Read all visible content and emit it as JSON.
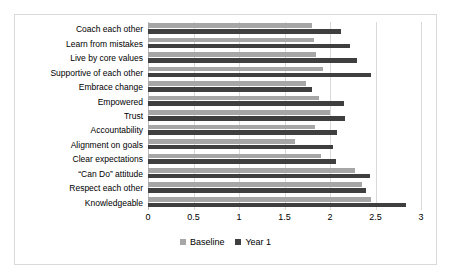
{
  "chart_data": {
    "type": "bar",
    "orientation": "horizontal",
    "title": "",
    "xlabel": "",
    "ylabel": "",
    "xlim": [
      0,
      3
    ],
    "xticks": [
      "0",
      "0.5",
      "1",
      "1.5",
      "2",
      "2.5",
      "3"
    ],
    "grid": true,
    "legend_position": "bottom",
    "categories": [
      "Coach each other",
      "Learn from mistakes",
      "Live by core values",
      "Supportive of each other",
      "Embrace change",
      "Empowered",
      "Trust",
      "Accountability",
      "Alignment on goals",
      "Clear expectations",
      "“Can Do” attitude",
      "Respect each other",
      "Knowledgeable"
    ],
    "series": [
      {
        "name": "Baseline",
        "color": "#a6a6a6",
        "values": [
          1.8,
          1.82,
          1.85,
          1.92,
          1.74,
          1.88,
          2.0,
          1.84,
          1.62,
          1.9,
          2.28,
          2.35,
          2.45
        ]
      },
      {
        "name": "Year 1",
        "color": "#3f3f3f",
        "values": [
          2.12,
          2.22,
          2.3,
          2.45,
          1.8,
          2.15,
          2.16,
          2.08,
          2.03,
          2.07,
          2.44,
          2.4,
          2.83
        ]
      }
    ]
  },
  "legend": {
    "items": [
      {
        "label": "Baseline",
        "color": "#a6a6a6"
      },
      {
        "label": "Year 1",
        "color": "#3f3f3f"
      }
    ]
  }
}
